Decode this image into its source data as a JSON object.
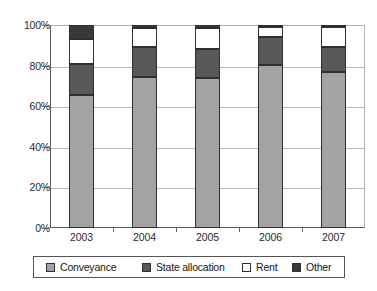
{
  "chart_data": {
    "type": "bar",
    "subtype": "stacked-percent",
    "title": "",
    "xlabel": "",
    "ylabel": "",
    "categories": [
      "2003",
      "2004",
      "2005",
      "2006",
      "2007"
    ],
    "ylim": [
      0,
      100
    ],
    "yticks": [
      "0%",
      "20%",
      "40%",
      "60%",
      "80%",
      "100%"
    ],
    "ytick_values": [
      0,
      20,
      40,
      60,
      80,
      100
    ],
    "grid": true,
    "legend_position": "bottom",
    "unit": "%",
    "series": [
      {
        "name": "Conveyance",
        "color": "#a3a3a3",
        "values": [
          65.5,
          74.5,
          74.0,
          80.5,
          77.0
        ]
      },
      {
        "name": "State allocation",
        "color": "#585858",
        "values": [
          15.5,
          14.5,
          14.0,
          13.5,
          12.0
        ]
      },
      {
        "name": "Rent",
        "color": "#ffffff",
        "values": [
          12.0,
          9.5,
          10.5,
          5.0,
          10.0
        ]
      },
      {
        "name": "Other",
        "color": "#3a3a3a",
        "values": [
          7.0,
          1.5,
          1.5,
          1.0,
          1.0
        ]
      }
    ]
  },
  "legend": {
    "items": [
      {
        "label": "Conveyance",
        "color": "#a3a3a3"
      },
      {
        "label": "State allocation",
        "color": "#585858"
      },
      {
        "label": "Rent",
        "color": "#ffffff"
      },
      {
        "label": "Other",
        "color": "#3a3a3a"
      }
    ]
  },
  "colors": {
    "conveyance": "#a3a3a3",
    "state_allocation": "#585858",
    "rent": "#ffffff",
    "other": "#3a3a3a",
    "axis": "#5a5a5a",
    "grid": "#b9b9b9",
    "text": "#1a1a1a"
  }
}
